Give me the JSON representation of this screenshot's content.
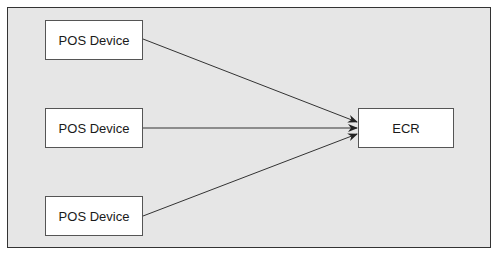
{
  "diagram": {
    "nodes": [
      {
        "id": "pos1",
        "label": "POS Device"
      },
      {
        "id": "pos2",
        "label": "POS Device"
      },
      {
        "id": "pos3",
        "label": "POS Device"
      },
      {
        "id": "ecr",
        "label": "ECR"
      }
    ],
    "edges": [
      {
        "from": "pos1",
        "to": "ecr"
      },
      {
        "from": "pos2",
        "to": "ecr"
      },
      {
        "from": "pos3",
        "to": "ecr"
      }
    ]
  }
}
